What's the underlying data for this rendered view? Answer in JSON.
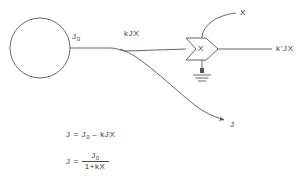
{
  "diagram": {
    "stroke_color": "#555555",
    "text_color": "#3a3a3a",
    "background": "#ffffff",
    "source": {
      "shape": "circle",
      "cx": 40,
      "cy": 48,
      "r": 30
    },
    "labels": {
      "source_output": "J",
      "source_output_sub": "0",
      "feedback_term": "kJX",
      "multiplier_symbol": "X",
      "multiplier_input_top": "X",
      "output": "k'JX",
      "branch_output": "J"
    },
    "multiplier": {
      "type": "chevron-block",
      "x": 186,
      "y": 38,
      "width": 32,
      "height": 22
    },
    "ground": {
      "type": "earth-ground",
      "x": 202,
      "y": 60
    },
    "equations": {
      "first": {
        "lhs": "J",
        "eq": "=",
        "rhs_a": "J",
        "rhs_a_sub": "0",
        "rhs_op": "–",
        "rhs_b": "kJX",
        "full": "J = J0 – kJX"
      },
      "second": {
        "lhs": "J  =",
        "numerator": "J",
        "numerator_sub": "0",
        "denominator": "1+kX",
        "full": "J = J0 / (1+kX)"
      }
    }
  }
}
